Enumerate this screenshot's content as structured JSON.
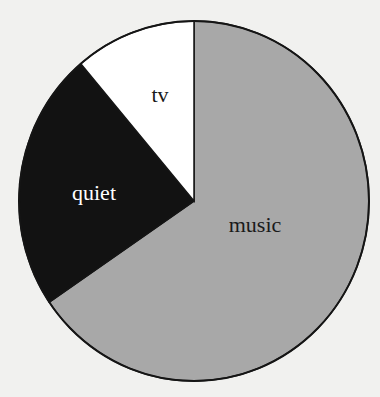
{
  "chart_data": {
    "type": "pie",
    "title": "",
    "categories": [
      "music",
      "quiet",
      "tv"
    ],
    "values": [
      65.5,
      23.3,
      11.2
    ],
    "unit": "percent (estimated from slice angles)",
    "start_angle_deg": 0,
    "direction": "clockwise",
    "slice_colors": {
      "music": "#a8a8a8",
      "quiet": "#121212",
      "tv": "#ffffff"
    },
    "label_colors": {
      "music": "#1a1a1a",
      "quiet": "#ffffff",
      "tv": "#1a1a1a"
    },
    "legend": "none (labels inside slices)"
  },
  "labels": {
    "music": "music",
    "quiet": "quiet",
    "tv": "tv"
  }
}
